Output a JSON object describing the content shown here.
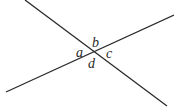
{
  "diagram": {
    "type": "intersecting-lines",
    "lines": [
      {
        "id": "line-1",
        "x1": 25,
        "y1": 0,
        "x2": 167,
        "y2": 106
      },
      {
        "id": "line-2",
        "x1": 6,
        "y1": 92,
        "x2": 174,
        "y2": 15
      }
    ],
    "intersection": {
      "x": 95,
      "y": 52
    },
    "angle_labels": [
      {
        "id": "a",
        "text": "a",
        "x": 76,
        "y": 57
      },
      {
        "id": "b",
        "text": "b",
        "x": 92,
        "y": 47
      },
      {
        "id": "c",
        "text": "c",
        "x": 106,
        "y": 58
      },
      {
        "id": "d",
        "text": "d",
        "x": 88,
        "y": 68
      }
    ],
    "colors": {
      "line": "#2b2b2b",
      "label": "#2a2a2a",
      "background": "#ffffff"
    }
  }
}
